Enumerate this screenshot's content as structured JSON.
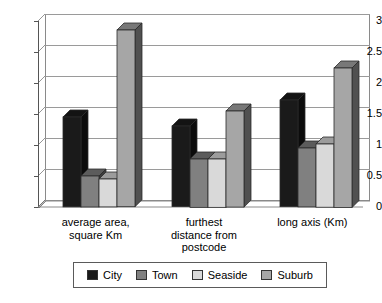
{
  "chart_data": {
    "type": "bar",
    "title": "",
    "subtitle": "",
    "xlabel": "",
    "ylabel": "",
    "ylim": [
      0,
      3
    ],
    "yticks": [
      "0",
      "0.5",
      "1",
      "1.5",
      "2",
      "2.5",
      "3"
    ],
    "ytick_values": [
      0,
      0.5,
      1,
      1.5,
      2,
      2.5,
      3
    ],
    "grid": true,
    "legend_position": "bottom",
    "style": "3d-clustered-column",
    "categories": [
      "average area, square Km",
      "furthest distance from postcode",
      "long axis (Km)"
    ],
    "category_label_lines": [
      [
        "average area,",
        "square Km"
      ],
      [
        "furthest",
        "distance from",
        "postcode"
      ],
      [
        "long axis (Km)"
      ]
    ],
    "series": [
      {
        "name": "City",
        "color": "#1a1a1a",
        "values": [
          1.45,
          1.3,
          1.72
        ]
      },
      {
        "name": "Town",
        "color": "#808080",
        "values": [
          0.5,
          0.78,
          0.95
        ]
      },
      {
        "name": "Seaside",
        "color": "#d9d9d9",
        "values": [
          0.45,
          0.78,
          1.02
        ]
      },
      {
        "name": "Suburb",
        "color": "#a6a6a6",
        "values": [
          2.85,
          1.55,
          2.25
        ]
      }
    ]
  },
  "legend": {
    "items": [
      {
        "label": "City",
        "color": "#1a1a1a"
      },
      {
        "label": "Town",
        "color": "#808080"
      },
      {
        "label": "Seaside",
        "color": "#d9d9d9"
      },
      {
        "label": "Suburb",
        "color": "#a6a6a6"
      }
    ]
  },
  "axis": {
    "y_tick_labels": [
      "3",
      "2.5",
      "2",
      "1.5",
      "1",
      "0.5",
      "0"
    ]
  }
}
